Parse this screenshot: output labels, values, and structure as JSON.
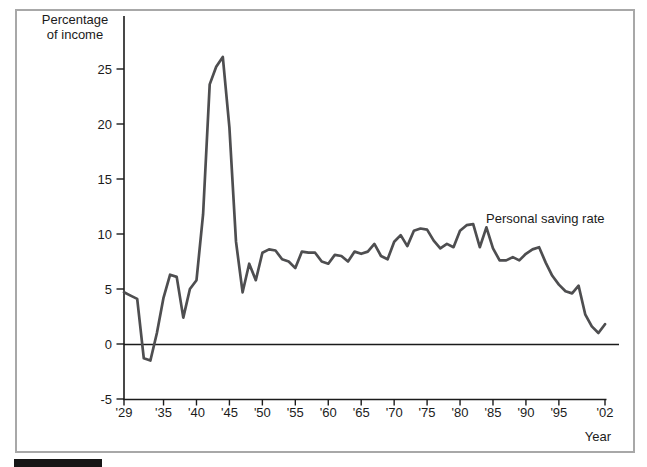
{
  "figure": {
    "y_axis_title_line1": "Percentage",
    "y_axis_title_line2": "of income",
    "series_label": "Personal saving rate",
    "x_axis_caption": "Year"
  },
  "chart_data": {
    "type": "line",
    "title": "",
    "ylabel": "Percentage of income",
    "xlabel": "Year",
    "ylim": [
      -5,
      28
    ],
    "xlim": [
      1929,
      2002
    ],
    "grid": false,
    "legend_position": "inline-annotation",
    "zero_line": true,
    "y_ticks": [
      25,
      20,
      15,
      10,
      5,
      0,
      -5
    ],
    "x_ticks": [
      {
        "year": 1929,
        "label": "'29"
      },
      {
        "year": 1935,
        "label": "'35"
      },
      {
        "year": 1940,
        "label": "'40"
      },
      {
        "year": 1945,
        "label": "'45"
      },
      {
        "year": 1950,
        "label": "'50"
      },
      {
        "year": 1955,
        "label": "'55"
      },
      {
        "year": 1960,
        "label": "'60"
      },
      {
        "year": 1965,
        "label": "'65"
      },
      {
        "year": 1970,
        "label": "'70"
      },
      {
        "year": 1975,
        "label": "'75"
      },
      {
        "year": 1980,
        "label": "'80"
      },
      {
        "year": 1985,
        "label": "'85"
      },
      {
        "year": 1990,
        "label": "'90"
      },
      {
        "year": 1995,
        "label": "'95"
      },
      {
        "year": 2002,
        "label": "'02"
      }
    ],
    "series": [
      {
        "name": "Personal saving rate",
        "years": [
          1929,
          1930,
          1931,
          1932,
          1933,
          1934,
          1935,
          1936,
          1937,
          1938,
          1939,
          1940,
          1941,
          1942,
          1943,
          1944,
          1945,
          1946,
          1947,
          1948,
          1949,
          1950,
          1951,
          1952,
          1953,
          1954,
          1955,
          1956,
          1957,
          1958,
          1959,
          1960,
          1961,
          1962,
          1963,
          1964,
          1965,
          1966,
          1967,
          1968,
          1969,
          1970,
          1971,
          1972,
          1973,
          1974,
          1975,
          1976,
          1977,
          1978,
          1979,
          1980,
          1981,
          1982,
          1983,
          1984,
          1985,
          1986,
          1987,
          1988,
          1989,
          1990,
          1991,
          1992,
          1993,
          1994,
          1995,
          1996,
          1997,
          1998,
          1999,
          2000,
          2001,
          2002
        ],
        "values": [
          4.7,
          4.4,
          4.1,
          -1.3,
          -1.5,
          1.0,
          4.2,
          6.3,
          6.1,
          2.4,
          5.0,
          5.8,
          11.8,
          23.6,
          25.2,
          26.1,
          19.7,
          9.3,
          4.7,
          7.3,
          5.8,
          8.3,
          8.6,
          8.5,
          7.7,
          7.5,
          6.9,
          8.4,
          8.3,
          8.3,
          7.5,
          7.3,
          8.1,
          8.0,
          7.5,
          8.4,
          8.2,
          8.4,
          9.1,
          8.0,
          7.7,
          9.3,
          9.9,
          8.9,
          10.3,
          10.5,
          10.4,
          9.4,
          8.7,
          9.1,
          8.8,
          10.3,
          10.8,
          10.9,
          8.8,
          10.6,
          8.7,
          7.6,
          7.6,
          7.9,
          7.6,
          8.2,
          8.6,
          8.8,
          7.4,
          6.2,
          5.4,
          4.8,
          4.6,
          5.3,
          2.7,
          1.6,
          1.0,
          1.8
        ]
      }
    ],
    "colors": {
      "line": "#4e4e50",
      "axis": "#1b1b1b",
      "text": "#1b1b1b",
      "frame_border": "#a8a8a8",
      "footer_bar": "#161616",
      "background": "#ffffff"
    }
  }
}
